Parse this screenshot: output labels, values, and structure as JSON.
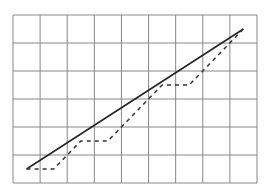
{
  "chart_data": {
    "type": "line",
    "title": "",
    "xlabel": "",
    "ylabel": "",
    "grid": true,
    "grid_columns": 9,
    "grid_rows": 6,
    "xlim": [
      0,
      9
    ],
    "ylim": [
      0,
      6
    ],
    "series": [
      {
        "name": "solid-line",
        "style": "solid",
        "color": "#222222",
        "points": [
          [
            0.5,
            0.5
          ],
          [
            8.5,
            5.5
          ]
        ]
      },
      {
        "name": "dashed-step-line",
        "style": "dashed",
        "color": "#333333",
        "points": [
          [
            0.5,
            0.5
          ],
          [
            1.5,
            0.5
          ],
          [
            2.5,
            1.5
          ],
          [
            3.5,
            1.5
          ],
          [
            5.5,
            3.5
          ],
          [
            6.5,
            3.5
          ],
          [
            8.5,
            5.5
          ]
        ]
      }
    ]
  },
  "layout": {
    "plot_left": 13,
    "plot_top": 15,
    "plot_width": 244,
    "plot_height": 168,
    "grid_color": "#888888",
    "background": "#ffffff"
  }
}
